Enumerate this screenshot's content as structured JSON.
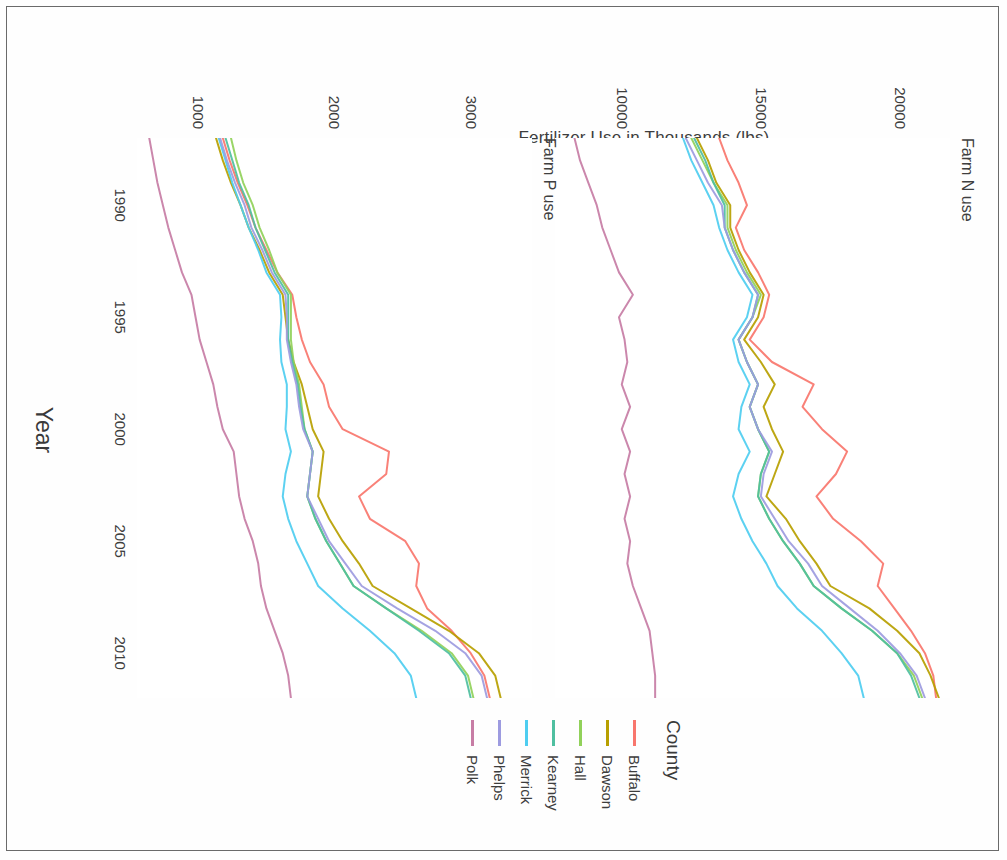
{
  "chart_data": {
    "type": "line",
    "title": "",
    "xlabel": "Year",
    "ylabel": "Fertilizer Use in Thousands (lbs)",
    "legend_title": "County",
    "legend_position": "right",
    "grid": false,
    "panels": [
      {
        "id": "farm-n-use",
        "label": "Farm N use",
        "ylim": [
          7600,
          21800
        ],
        "yticks": [
          10000,
          15000,
          20000
        ],
        "ytick_labels": [
          "10000",
          "15000",
          "20000"
        ],
        "xlim": [
          1987,
          2012
        ],
        "series": [
          {
            "name": "Buffalo",
            "color": "#f8766d",
            "x": [
              1987,
              1988,
              1989,
              1990,
              1991,
              1992,
              1993,
              1994,
              1995,
              1996,
              1997,
              1998,
              1999,
              2000,
              2001,
              2002,
              2003,
              2004,
              2005,
              2006,
              2007,
              2008,
              2009,
              2010,
              2011,
              2012
            ],
            "values": [
              13500,
              13800,
              14200,
              14500,
              14100,
              14400,
              14900,
              15300,
              15100,
              14600,
              15400,
              16900,
              16500,
              17200,
              18100,
              17700,
              17000,
              17600,
              18600,
              19400,
              19200,
              19800,
              20400,
              20900,
              21200,
              21300
            ]
          },
          {
            "name": "Dawson",
            "color": "#b79f00",
            "x": [
              1987,
              1988,
              1989,
              1990,
              1991,
              1992,
              1993,
              1994,
              1995,
              1996,
              1997,
              1998,
              1999,
              2000,
              2001,
              2002,
              2003,
              2004,
              2005,
              2006,
              2007,
              2008,
              2009,
              2010,
              2011,
              2012
            ],
            "values": [
              12700,
              13100,
              13400,
              13900,
              13900,
              14200,
              14600,
              15100,
              14900,
              14400,
              15000,
              15500,
              15100,
              15400,
              15800,
              15500,
              15200,
              15900,
              16400,
              17000,
              17500,
              18900,
              19900,
              20700,
              21100,
              21400
            ]
          },
          {
            "name": "Hall",
            "color": "#91d15a",
            "x": [
              1987,
              1988,
              1989,
              1990,
              1991,
              1992,
              1993,
              1994,
              1995,
              1996,
              1997,
              1998,
              1999,
              2000,
              2001,
              2002,
              2003,
              2004,
              2005,
              2006,
              2007,
              2008,
              2009,
              2010,
              2011,
              2012
            ],
            "values": [
              12500,
              12900,
              13300,
              13800,
              13800,
              14100,
              14500,
              15000,
              14700,
              14200,
              14500,
              14900,
              14600,
              14900,
              15300,
              15000,
              14900,
              15300,
              15800,
              16400,
              16900,
              17900,
              19000,
              19900,
              20500,
              20800
            ]
          },
          {
            "name": "Kearney",
            "color": "#4fbfa0",
            "x": [
              1987,
              1988,
              1989,
              1990,
              1991,
              1992,
              1993,
              1994,
              1995,
              1996,
              1997,
              1998,
              1999,
              2000,
              2001,
              2002,
              2003,
              2004,
              2005,
              2006,
              2007,
              2008,
              2009,
              2010,
              2011,
              2012
            ],
            "values": [
              12600,
              13000,
              13300,
              13700,
              13700,
              14000,
              14400,
              14900,
              14700,
              14200,
              14500,
              14900,
              14600,
              14900,
              15300,
              15000,
              14900,
              15300,
              15800,
              16400,
              16900,
              17900,
              19000,
              19900,
              20400,
              20700
            ]
          },
          {
            "name": "Merrick",
            "color": "#4ecdf0",
            "x": [
              1987,
              1988,
              1989,
              1990,
              1991,
              1992,
              1993,
              1994,
              1995,
              1996,
              1997,
              1998,
              1999,
              2000,
              2001,
              2002,
              2003,
              2004,
              2005,
              2006,
              2007,
              2008,
              2009,
              2010,
              2011,
              2012
            ],
            "values": [
              12200,
              12500,
              12900,
              13300,
              13500,
              13800,
              14200,
              14700,
              14500,
              14000,
              14200,
              14600,
              14300,
              14200,
              14600,
              14200,
              14000,
              14300,
              14700,
              15200,
              15600,
              16300,
              17200,
              17900,
              18500,
              18700
            ]
          },
          {
            "name": "Phelps",
            "color": "#9d9be0",
            "x": [
              1987,
              1988,
              1989,
              1990,
              1991,
              1992,
              1993,
              1994,
              1995,
              1996,
              1997,
              1998,
              1999,
              2000,
              2001,
              2002,
              2003,
              2004,
              2005,
              2006,
              2007,
              2008,
              2009,
              2010,
              2011,
              2012
            ],
            "values": [
              12300,
              12700,
              13100,
              13600,
              13700,
              14000,
              14400,
              14900,
              14700,
              14200,
              14500,
              14900,
              14600,
              14900,
              15400,
              15100,
              15000,
              15500,
              16000,
              16700,
              17200,
              18200,
              19200,
              20000,
              20600,
              20900
            ]
          },
          {
            "name": "Polk",
            "color": "#c77da5",
            "x": [
              1987,
              1988,
              1989,
              1990,
              1991,
              1992,
              1993,
              1994,
              1995,
              1996,
              1997,
              1998,
              1999,
              2000,
              2001,
              2002,
              2003,
              2004,
              2005,
              2006,
              2007,
              2008,
              2009,
              2010,
              2011,
              2012
            ],
            "values": [
              8300,
              8500,
              8800,
              9100,
              9300,
              9600,
              9900,
              10400,
              9900,
              10100,
              10200,
              10000,
              10300,
              10000,
              10300,
              10100,
              10300,
              10100,
              10300,
              10200,
              10400,
              10700,
              11000,
              11100,
              11200,
              11200
            ]
          }
        ]
      },
      {
        "id": "farm-p-use",
        "label": "Farm P use",
        "ylim": [
          550,
          3450
        ],
        "yticks": [
          1000,
          2000,
          3000
        ],
        "ytick_labels": [
          "1000",
          "2000",
          "3000"
        ],
        "xlim": [
          1987,
          2012
        ],
        "series": [
          {
            "name": "Buffalo",
            "color": "#f8766d",
            "x": [
              1987,
              1988,
              1989,
              1990,
              1991,
              1992,
              1993,
              1994,
              1995,
              1996,
              1997,
              1998,
              1999,
              2000,
              2001,
              2002,
              2003,
              2004,
              2005,
              2006,
              2007,
              2008,
              2009,
              2010,
              2011,
              2012
            ],
            "values": [
              1180,
              1230,
              1290,
              1360,
              1420,
              1500,
              1580,
              1690,
              1720,
              1760,
              1820,
              1920,
              1960,
              2060,
              2400,
              2380,
              2180,
              2260,
              2520,
              2620,
              2600,
              2680,
              2860,
              3000,
              3100,
              3140
            ]
          },
          {
            "name": "Dawson",
            "color": "#b79f00",
            "x": [
              1987,
              1988,
              1989,
              1990,
              1991,
              1992,
              1993,
              1994,
              1995,
              1996,
              1997,
              1998,
              1999,
              2000,
              2001,
              2002,
              2003,
              2004,
              2005,
              2006,
              2007,
              2008,
              2009,
              2010,
              2011,
              2012
            ],
            "values": [
              1130,
              1180,
              1240,
              1310,
              1370,
              1450,
              1520,
              1620,
              1640,
              1660,
              1700,
              1760,
              1800,
              1840,
              1920,
              1900,
              1880,
              1960,
              2060,
              2180,
              2280,
              2560,
              2840,
              3060,
              3180,
              3220
            ]
          },
          {
            "name": "Hall",
            "color": "#91d15a",
            "x": [
              1987,
              1988,
              1989,
              1990,
              1991,
              1992,
              1993,
              1994,
              1995,
              1996,
              1997,
              1998,
              1999,
              2000,
              2001,
              2002,
              2003,
              2004,
              2005,
              2006,
              2007,
              2008,
              2009,
              2010,
              2011,
              2012
            ],
            "values": [
              1240,
              1280,
              1330,
              1400,
              1450,
              1520,
              1580,
              1680,
              1680,
              1680,
              1700,
              1740,
              1760,
              1780,
              1840,
              1820,
              1800,
              1860,
              1940,
              2040,
              2140,
              2380,
              2640,
              2860,
              2980,
              3020
            ]
          },
          {
            "name": "Kearney",
            "color": "#4fbfa0",
            "x": [
              1987,
              1988,
              1989,
              1990,
              1991,
              1992,
              1993,
              1994,
              1995,
              1996,
              1997,
              1998,
              1999,
              2000,
              2001,
              2002,
              2003,
              2004,
              2005,
              2006,
              2007,
              2008,
              2009,
              2010,
              2011,
              2012
            ],
            "values": [
              1200,
              1250,
              1300,
              1370,
              1420,
              1490,
              1560,
              1660,
              1660,
              1660,
              1690,
              1730,
              1750,
              1780,
              1840,
              1820,
              1800,
              1860,
              1940,
              2040,
              2140,
              2380,
              2620,
              2840,
              2960,
              3000
            ]
          },
          {
            "name": "Merrick",
            "color": "#4ecdf0",
            "x": [
              1987,
              1988,
              1989,
              1990,
              1991,
              1992,
              1993,
              1994,
              1995,
              1996,
              1997,
              1998,
              1999,
              2000,
              2001,
              2002,
              2003,
              2004,
              2005,
              2006,
              2007,
              2008,
              2009,
              2010,
              2011,
              2012
            ],
            "values": [
              1150,
              1200,
              1250,
              1310,
              1370,
              1440,
              1500,
              1600,
              1610,
              1600,
              1610,
              1650,
              1650,
              1640,
              1680,
              1640,
              1620,
              1660,
              1720,
              1800,
              1880,
              2060,
              2260,
              2440,
              2560,
              2600
            ]
          },
          {
            "name": "Phelps",
            "color": "#9d9be0",
            "x": [
              1987,
              1988,
              1989,
              1990,
              1991,
              1992,
              1993,
              1994,
              1995,
              1996,
              1997,
              1998,
              1999,
              2000,
              2001,
              2002,
              2003,
              2004,
              2005,
              2006,
              2007,
              2008,
              2009,
              2010,
              2011,
              2012
            ],
            "values": [
              1160,
              1210,
              1270,
              1340,
              1390,
              1470,
              1540,
              1640,
              1650,
              1650,
              1680,
              1720,
              1740,
              1770,
              1840,
              1820,
              1800,
              1880,
              1960,
              2080,
              2200,
              2460,
              2740,
              2960,
              3080,
              3120
            ]
          },
          {
            "name": "Polk",
            "color": "#c77da5",
            "x": [
              1987,
              1988,
              1989,
              1990,
              1991,
              1992,
              1993,
              1994,
              1995,
              1996,
              1997,
              1998,
              1999,
              2000,
              2001,
              2002,
              2003,
              2004,
              2005,
              2006,
              2007,
              2008,
              2009,
              2010,
              2011,
              2012
            ],
            "values": [
              640,
              670,
              700,
              740,
              780,
              830,
              880,
              950,
              980,
              1010,
              1060,
              1110,
              1140,
              1180,
              1260,
              1280,
              1300,
              1340,
              1400,
              1440,
              1460,
              1500,
              1560,
              1620,
              1660,
              1680
            ]
          }
        ],
        "xticks": [
          1990,
          1995,
          2000,
          2005,
          2010
        ],
        "xtick_labels": [
          "1990",
          "1995",
          "2000",
          "2005",
          "2010"
        ]
      }
    ],
    "xticks": [
      1990,
      1995,
      2000,
      2005,
      2010
    ],
    "xtick_labels": [
      "1990",
      "1995",
      "2000",
      "2005",
      "2010"
    ],
    "legend_entries": [
      {
        "label": "Buffalo",
        "color": "#f8766d"
      },
      {
        "label": "Dawson",
        "color": "#b79f00"
      },
      {
        "label": "Hall",
        "color": "#91d15a"
      },
      {
        "label": "Kearney",
        "color": "#4fbfa0"
      },
      {
        "label": "Merrick",
        "color": "#4ecdf0"
      },
      {
        "label": "Phelps",
        "color": "#9d9be0"
      },
      {
        "label": "Polk",
        "color": "#c77da5"
      }
    ]
  }
}
